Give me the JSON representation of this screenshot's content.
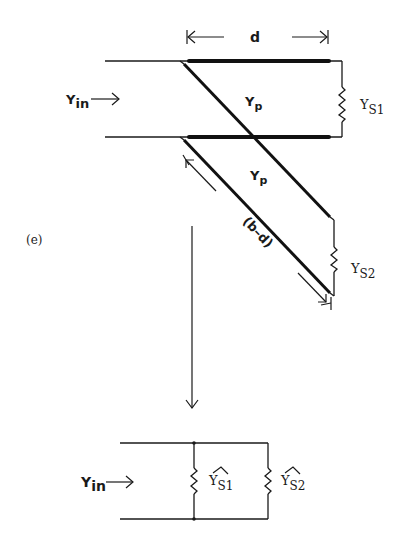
{
  "figure": {
    "label": "(e)",
    "top_circuit": {
      "input_label": "Y",
      "input_sub": "in",
      "dimension_label": "d",
      "line_admittance_upper": {
        "main": "Y",
        "sub": "p"
      },
      "line_admittance_lower": {
        "main": "Y",
        "sub": "p"
      },
      "stub_length_label": "(b–d)",
      "load1": {
        "main": "Y",
        "sub": "S1"
      },
      "load2": {
        "main": "Y",
        "sub": "S2"
      }
    },
    "bottom_circuit": {
      "input_label": "Y",
      "input_sub": "in",
      "load1": {
        "main": "Y",
        "sub": "S1",
        "accent": "^"
      },
      "load2": {
        "main": "Y",
        "sub": "S2",
        "accent": "^"
      }
    }
  }
}
